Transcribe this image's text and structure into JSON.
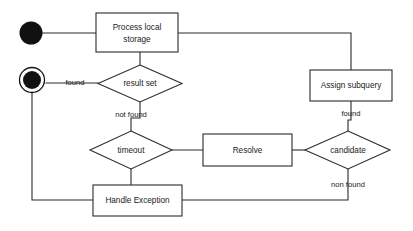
{
  "diagram": {
    "type": "uml-activity-diagram",
    "title": "",
    "background_color": "#ffffff",
    "line_color": "#2b2b2b",
    "text_color": "#1a1a1a",
    "nodes": {
      "initial": {
        "name": "initial-node",
        "kind": "initial"
      },
      "final": {
        "name": "final-node",
        "kind": "final"
      },
      "process_local_storage": {
        "kind": "action",
        "label_line1": "Process local",
        "label_line2": "storage"
      },
      "assign_subquery": {
        "kind": "action",
        "label": "Assign subquery"
      },
      "resolve": {
        "kind": "action",
        "label": "Resolve"
      },
      "handle_exception": {
        "kind": "action",
        "label": "Handle Exception"
      },
      "result_set": {
        "kind": "decision",
        "label": "result set"
      },
      "timeout": {
        "kind": "decision",
        "label": "timeout"
      },
      "candidate": {
        "kind": "decision",
        "label": "candidate"
      }
    },
    "guards": {
      "result_set_found": "found",
      "result_set_not_found": "not found",
      "candidate_found": "found",
      "candidate_non_found": "non found"
    }
  }
}
